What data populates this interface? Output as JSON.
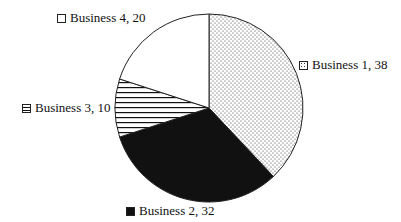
{
  "chart_data": {
    "type": "pie",
    "title": "",
    "categories": [
      "Business 1",
      "Business 2",
      "Business 3",
      "Business 4"
    ],
    "values": [
      38,
      32,
      10,
      20
    ],
    "fills": [
      "dotted",
      "solid-black",
      "horizontal-lines",
      "white"
    ],
    "start_angle": "12 o'clock",
    "direction": "clockwise",
    "labels": [
      {
        "text": "Business 1, 38",
        "swatch": "dotted"
      },
      {
        "text": "Business 2, 32",
        "swatch": "solid-black"
      },
      {
        "text": "Business 3, 10",
        "swatch": "horizontal-lines"
      },
      {
        "text": "Business 4, 20",
        "swatch": "white"
      }
    ]
  }
}
